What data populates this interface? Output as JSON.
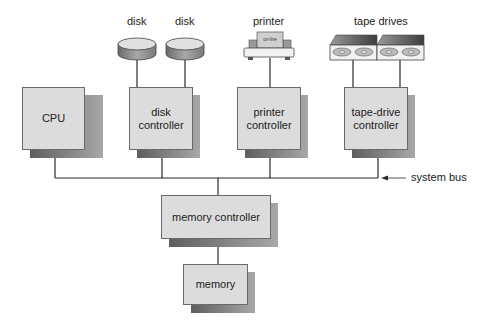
{
  "diagram": {
    "devices": {
      "disk_left": "disk",
      "disk_right": "disk",
      "printer": "printer",
      "printer_display": "on-line",
      "tape": "tape drives"
    },
    "components": {
      "cpu": [
        "CPU"
      ],
      "disk_controller": [
        "disk",
        "controller"
      ],
      "printer_controller": [
        "printer",
        "controller"
      ],
      "tape_controller": [
        "tape-drive",
        "controller"
      ],
      "memory_controller": [
        "memory controller"
      ],
      "memory": [
        "memory"
      ]
    },
    "annotations": {
      "system_bus": "system bus"
    },
    "colors": {
      "box_fill": "#dcdcdc",
      "box_border": "#6a6a6a",
      "shadow": "#6e6e6e",
      "line": "#2a2a2a"
    }
  }
}
